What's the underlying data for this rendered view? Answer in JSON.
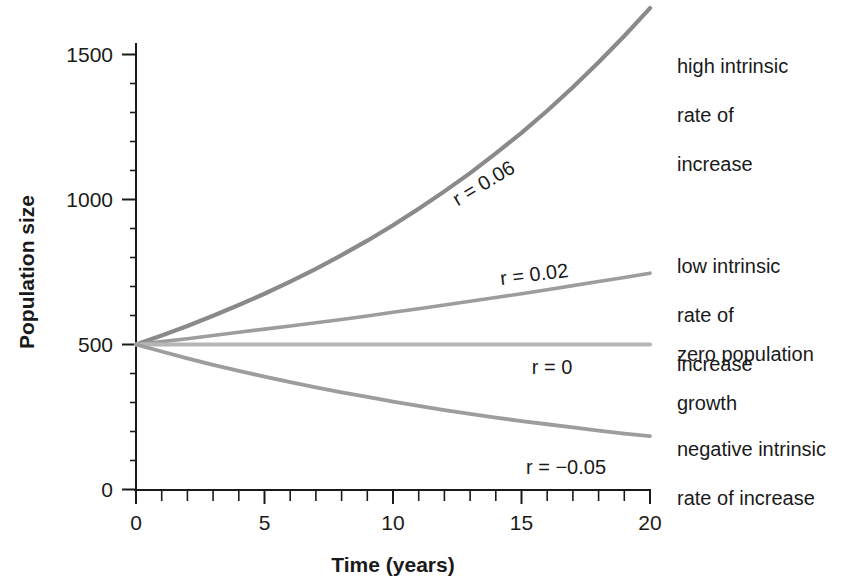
{
  "chart_data": {
    "type": "line",
    "title": "",
    "xlabel": "Time (years)",
    "ylabel": "Population size",
    "xlim": [
      0,
      20
    ],
    "ylim": [
      0,
      1600
    ],
    "grid": false,
    "legend_position": "right-inline",
    "x_ticks": [
      "0",
      "5",
      "10",
      "15",
      "20"
    ],
    "x_tick_values": [
      0,
      5,
      10,
      15,
      20
    ],
    "x_minor_tick_step": 1,
    "y_ticks": [
      "0",
      "500",
      "1000",
      "1500"
    ],
    "y_tick_values": [
      0,
      500,
      1000,
      1500
    ],
    "x": [
      0,
      1,
      2,
      3,
      4,
      5,
      6,
      7,
      8,
      9,
      10,
      11,
      12,
      13,
      14,
      15,
      16,
      17,
      18,
      19,
      20
    ],
    "series": [
      {
        "name": "high intrinsic rate of increase",
        "r": 0.06,
        "curve_label": "r = 0.06",
        "annotation": "high intrinsic\nrate of\nincrease",
        "color": "#8a8a8a",
        "values": [
          500,
          531,
          564,
          599,
          636,
          675,
          717,
          761,
          808,
          858,
          911,
          968,
          1028,
          1091,
          1159,
          1230,
          1306,
          1387,
          1473,
          1564,
          1660
        ]
      },
      {
        "name": "low intrinsic rate of increase",
        "r": 0.02,
        "curve_label": "r = 0.02",
        "annotation": "low intrinsic\nrate of\nincrease",
        "color": "#9d9d9d",
        "values": [
          500,
          510,
          520,
          531,
          542,
          553,
          564,
          575,
          586,
          598,
          611,
          623,
          636,
          649,
          662,
          675,
          689,
          703,
          717,
          731,
          746
        ]
      },
      {
        "name": "zero population growth",
        "r": 0,
        "curve_label": "r = 0",
        "annotation": "zero population\ngrowth",
        "color": "#b6b6b6",
        "values": [
          500,
          500,
          500,
          500,
          500,
          500,
          500,
          500,
          500,
          500,
          500,
          500,
          500,
          500,
          500,
          500,
          500,
          500,
          500,
          500,
          500
        ]
      },
      {
        "name": "negative intrinsic rate of increase",
        "r": -0.05,
        "curve_label": "r = −0.05",
        "annotation": "negative intrinsic\nrate of increase",
        "color": "#9d9d9d",
        "values": [
          500,
          476,
          452,
          430,
          409,
          389,
          370,
          352,
          335,
          319,
          303,
          288,
          274,
          261,
          248,
          236,
          225,
          214,
          203,
          193,
          184
        ]
      }
    ]
  },
  "axis": {
    "x_label": "Time (years)",
    "y_label": "Population size"
  },
  "annotations": {
    "high": {
      "line1": "high intrinsic",
      "line2": "rate of",
      "line3": "increase"
    },
    "low": {
      "line1": "low intrinsic",
      "line2": "rate of",
      "line3": "increase"
    },
    "zero": {
      "line1": "zero population",
      "line2": "growth"
    },
    "negative": {
      "line1": "negative intrinsic",
      "line2": "rate of increase"
    }
  },
  "curve_labels": {
    "high": "r = 0.06",
    "low": "r = 0.02",
    "zero": "r = 0",
    "negative": "r = −0.05"
  },
  "tick_labels": {
    "y": [
      "1500",
      "1000",
      "500",
      "0"
    ],
    "x": [
      "0",
      "5",
      "10",
      "15",
      "20"
    ]
  }
}
